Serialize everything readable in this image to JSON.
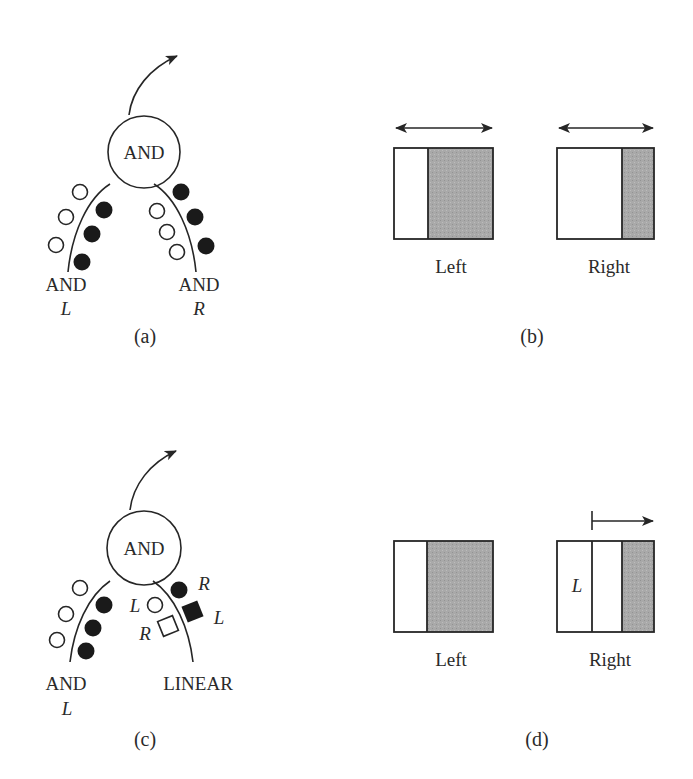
{
  "figure": {
    "panels": [
      {
        "id": "a",
        "caption": "(a)",
        "node_label": "AND",
        "left_input": {
          "label": "AND",
          "sublabel": "L"
        },
        "right_input": {
          "label": "AND",
          "sublabel": "R"
        },
        "left_tokens": {
          "open": 3,
          "filled": 3
        },
        "right_tokens": {
          "open": 3,
          "filled": 3
        }
      },
      {
        "id": "b",
        "caption": "(b)",
        "left_box": {
          "label": "Left",
          "arrow": "bidirectional"
        },
        "right_box": {
          "label": "Right",
          "arrow": "bidirectional"
        }
      },
      {
        "id": "c",
        "caption": "(c)",
        "node_label": "AND",
        "left_input": {
          "label": "AND",
          "sublabel": "L"
        },
        "right_input": {
          "label": "LINEAR"
        },
        "left_tokens": {
          "open": 3,
          "filled": 3
        },
        "right_token_labels": {
          "filled_circle": "R",
          "open_circle": "L",
          "filled_square": "L",
          "open_square": "R"
        }
      },
      {
        "id": "d",
        "caption": "(d)",
        "left_box": {
          "label": "Left"
        },
        "right_box": {
          "label": "Right",
          "inner_label": "L",
          "arrow": "rightward"
        }
      }
    ],
    "colors": {
      "ink": "#262626",
      "shade": "#a8a8a8",
      "paper": "#ffffff"
    }
  }
}
